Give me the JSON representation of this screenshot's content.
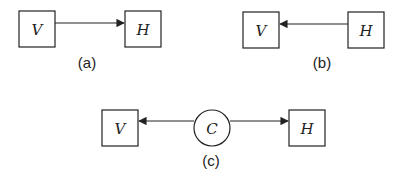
{
  "diagrams": [
    {
      "id": "a",
      "caption": "(a)",
      "nodes": [
        {
          "label": "V",
          "shape": "square"
        },
        {
          "label": "H",
          "shape": "square"
        }
      ],
      "edges": [
        {
          "from": "V",
          "to": "H"
        }
      ]
    },
    {
      "id": "b",
      "caption": "(b)",
      "nodes": [
        {
          "label": "V",
          "shape": "square"
        },
        {
          "label": "H",
          "shape": "square"
        }
      ],
      "edges": [
        {
          "from": "H",
          "to": "V"
        }
      ]
    },
    {
      "id": "c",
      "caption": "(c)",
      "nodes": [
        {
          "label": "V",
          "shape": "square"
        },
        {
          "label": "C",
          "shape": "circle"
        },
        {
          "label": "H",
          "shape": "square"
        }
      ],
      "edges": [
        {
          "from": "C",
          "to": "V"
        },
        {
          "from": "C",
          "to": "H"
        }
      ]
    }
  ]
}
